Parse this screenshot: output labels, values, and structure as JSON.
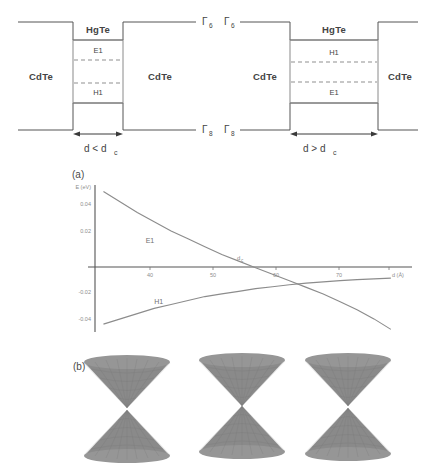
{
  "figure": {
    "panel_a_label": "(a)",
    "panel_b_label": "(b)"
  },
  "wells": {
    "left": {
      "barrier_material": "CdTe",
      "well_material": "HgTe",
      "upper_subband": "E1",
      "lower_subband": "H1",
      "gamma_top": "Γ",
      "gamma_top_sub": "6",
      "gamma_bottom": "Γ",
      "gamma_bottom_sub": "8",
      "width_label": "d < d",
      "width_label_sub": "c"
    },
    "right": {
      "barrier_material": "CdTe",
      "well_material": "HgTe",
      "upper_subband": "H1",
      "lower_subband": "E1",
      "gamma_top": "Γ",
      "gamma_top_sub": "6",
      "gamma_bottom": "Γ",
      "gamma_bottom_sub": "8",
      "width_label": "d > d",
      "width_label_sub": "c"
    }
  },
  "chart_data": {
    "type": "line",
    "title": "(a)",
    "xlabel": "d (Å)",
    "ylabel": "E (eV)",
    "xlim": [
      30,
      105
    ],
    "ylim": [
      -0.05,
      0.062
    ],
    "xticks": [
      40,
      50,
      60,
      70,
      80
    ],
    "xticklabels": [
      "40",
      "50",
      "60",
      "70",
      "80"
    ],
    "yticks": [
      0.04,
      0.02,
      -0.02,
      -0.04
    ],
    "yticklabels": [
      "0.04",
      "0.02",
      "-0.02",
      "-0.04"
    ],
    "grid": false,
    "legend": "inline-labels",
    "annotations": [
      {
        "text": "d",
        "sub": "c",
        "x": 63,
        "y": 0.009
      }
    ],
    "series": [
      {
        "name": "E1",
        "label": "E1",
        "label_x": 42,
        "label_y": 0.018,
        "x": [
          32,
          36,
          40,
          44,
          48,
          52,
          56,
          60,
          64,
          68,
          72,
          76,
          80,
          84,
          88,
          92,
          96,
          100
        ],
        "values": [
          0.057,
          0.049,
          0.041,
          0.034,
          0.027,
          0.021,
          0.015,
          0.009,
          0.004,
          -0.001,
          -0.006,
          -0.011,
          -0.016,
          -0.021,
          -0.027,
          -0.033,
          -0.04,
          -0.048
        ]
      },
      {
        "name": "H1",
        "label": "H1",
        "label_x": 44,
        "label_y": -0.029,
        "x": [
          32,
          36,
          40,
          44,
          48,
          52,
          56,
          60,
          64,
          68,
          72,
          76,
          80,
          84,
          88,
          92,
          96,
          100
        ],
        "values": [
          -0.044,
          -0.04,
          -0.036,
          -0.032,
          -0.029,
          -0.026,
          -0.023,
          -0.021,
          -0.019,
          -0.017,
          -0.0155,
          -0.014,
          -0.0128,
          -0.0118,
          -0.0109,
          -0.0101,
          -0.0095,
          -0.009
        ]
      }
    ]
  },
  "cones": {
    "items": [
      {
        "name": "gapped-normal",
        "gap": "open"
      },
      {
        "name": "gapless-critical",
        "gap": "closed"
      },
      {
        "name": "inverted",
        "gap": "closed"
      }
    ]
  }
}
